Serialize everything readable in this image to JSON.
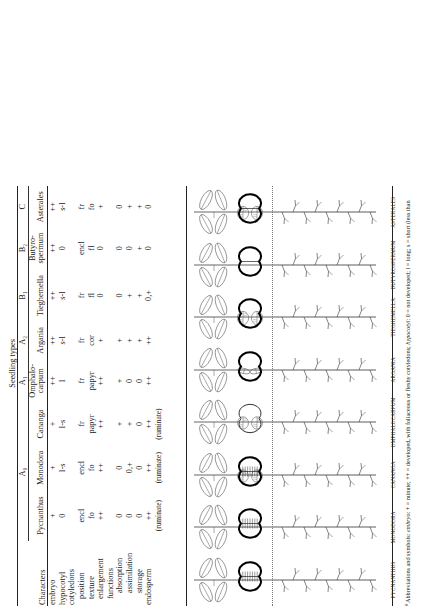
{
  "figure": {
    "group_header": "Seedling types",
    "characters_header": "Characters",
    "footnote_marker": "ª",
    "footnote": "Abbreviations and symbols:  embryo: + = minute;  ++ = developed, with foliaceous or fleshy cotyledons;  hypocotyl: 0 = not developed;  l = long;  s = short (less than",
    "footnote_italics": [
      "embryo",
      "hypocotyl"
    ]
  },
  "columns": [
    {
      "group": "A₀",
      "genus": "Pycnanthus",
      "plate": "PYCNANTHUS"
    },
    {
      "group": "A₀",
      "genus": "Monodora",
      "plate": "MONODORA"
    },
    {
      "group": "A₀",
      "genus": "Cananga",
      "plate": "CANANGA"
    },
    {
      "group": "A₁",
      "genus": "Omphalo-carpum",
      "genus_l1": "Omphalo-",
      "genus_l2": "carpum",
      "plate": "OMPHALOCARPUM"
    },
    {
      "group": "A₂",
      "genus": "Argania",
      "plate": "ARGANIA"
    },
    {
      "group": "B₁",
      "genus": "Tieghemella",
      "plate": "TIEGHEMELLA"
    },
    {
      "group": "B₂",
      "genus": "Butyro-spermum",
      "genus_l1": "Butyro-",
      "genus_l2": "spermum",
      "plate": "BUTYROSPERMUM"
    },
    {
      "group": "C",
      "genus": "Asterales",
      "plate": "ASTERALES"
    }
  ],
  "group_spans": [
    {
      "label": "A₀",
      "cols": 3
    },
    {
      "label": "A₁",
      "cols": 1
    },
    {
      "label": "A₂",
      "cols": 1
    },
    {
      "label": "B₁",
      "cols": 1
    },
    {
      "label": "B₂",
      "cols": 1
    },
    {
      "label": "C",
      "cols": 1
    }
  ],
  "rows": [
    {
      "label": "embryo",
      "indent": 0,
      "values": [
        "+",
        "+",
        "+",
        "++",
        "++",
        "++",
        "++",
        "++"
      ]
    },
    {
      "label": "hypocotyl",
      "indent": 0,
      "values": [
        "0",
        "l-s",
        "l-s",
        "l",
        "s-l",
        "s-l",
        "0",
        "s-l"
      ]
    },
    {
      "label": "cotyledons",
      "indent": 0,
      "values": [
        "",
        "",
        "",
        "",
        "",
        "",
        "",
        ""
      ]
    },
    {
      "label": "position",
      "indent": 1,
      "values": [
        "encl",
        "encl",
        "fr",
        "fr",
        "fr",
        "fr",
        "encl",
        "fr"
      ]
    },
    {
      "label": "texture",
      "indent": 1,
      "values": [
        "fo",
        "fo",
        "papyr",
        "papyr",
        "cor",
        "fl",
        "fl",
        "fo"
      ]
    },
    {
      "label": "enlargement",
      "indent": 1,
      "values": [
        "++",
        "++",
        "++",
        "++",
        "+",
        "0",
        "0",
        "+"
      ]
    },
    {
      "label": "functions",
      "indent": 1,
      "values": [
        "",
        "",
        "",
        "",
        "",
        "",
        "",
        ""
      ]
    },
    {
      "label": "absorption",
      "indent": 2,
      "values": [
        "0",
        "0",
        "+",
        "+",
        "+",
        "0",
        "0",
        "0"
      ]
    },
    {
      "label": "assimilation",
      "indent": 2,
      "values": [
        "0",
        "0,+",
        "+",
        "0",
        "+",
        "+",
        "0",
        "+"
      ]
    },
    {
      "label": "storage",
      "indent": 2,
      "values": [
        "0",
        "0",
        "0",
        "0",
        "+",
        "+",
        "+",
        "+"
      ]
    },
    {
      "label": "endosperm",
      "indent": 0,
      "values": [
        "++",
        "++",
        "++",
        "++",
        "++",
        "0,+",
        "0",
        "0"
      ]
    },
    {
      "label": "",
      "indent": 0,
      "ruminate": true,
      "values": [
        "(ruminate)",
        "(ruminate)",
        "(ruminate)",
        "",
        "",
        "",
        "",
        ""
      ]
    }
  ],
  "plates": [
    {
      "name": "PYCNANTHUS",
      "seed": "dark-thick-ruminate",
      "cotyledons": "enclosed",
      "leaves": 4
    },
    {
      "name": "MONODORA",
      "seed": "dark-thick-ruminate",
      "cotyledons": "enclosed",
      "leaves": 4
    },
    {
      "name": "CANANGA",
      "seed": "dark-ruminate-pair",
      "cotyledons": "free-papery",
      "leaves": 4
    },
    {
      "name": "OMPHALOCARPUM",
      "seed": "outline-open",
      "cotyledons": "free-papery",
      "leaves": 4
    },
    {
      "name": "ARGANIA",
      "seed": "dark-outline",
      "cotyledons": "free-strap",
      "leaves": 4
    },
    {
      "name": "TIEGHEMELLA",
      "seed": "dark-outline",
      "cotyledons": "free-fleshy",
      "leaves": 4
    },
    {
      "name": "BUTYROSPERMUM",
      "seed": "dark-outline-split",
      "cotyledons": "enclosed-fleshy",
      "leaves": 4
    },
    {
      "name": "ASTERALES",
      "seed": "dark-outline-split",
      "cotyledons": "free-foliaceous",
      "leaves": 4
    }
  ],
  "colors": {
    "ink": "#1a1a1a",
    "line": "#222222",
    "drawing": "#555555",
    "seed_dark": "#000000",
    "soil": "#777777"
  }
}
